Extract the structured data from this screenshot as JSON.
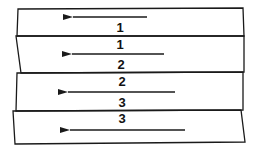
{
  "diagram": {
    "stroke_color": "#1a1a1a",
    "strips": [
      {
        "id": 1,
        "top_label": "",
        "bottom_label": "1",
        "points": "18,9 243,8 244,36 17,36",
        "arrow": {
          "x1": 147,
          "x2": 65,
          "y": 17
        }
      },
      {
        "id": 2,
        "top_label": "1",
        "bottom_label": "2",
        "points": "16,36 244,36 244,72 21,73",
        "arrow": {
          "x1": 164,
          "x2": 64,
          "y": 54
        }
      },
      {
        "id": 3,
        "top_label": "2",
        "bottom_label": "3",
        "points": "17,73 243,72 243,110 16,111",
        "arrow": {
          "x1": 175,
          "x2": 60,
          "y": 92
        }
      },
      {
        "id": 4,
        "top_label": "3",
        "bottom_label": "",
        "points": "13,111 241,110 245,142 15,144",
        "arrow": {
          "x1": 185,
          "x2": 62,
          "y": 130
        }
      }
    ],
    "labels": [
      {
        "text": "1",
        "x": 120,
        "y": 32
      },
      {
        "text": "1",
        "x": 120,
        "y": 49
      },
      {
        "text": "2",
        "x": 121,
        "y": 69
      },
      {
        "text": "2",
        "x": 122,
        "y": 86
      },
      {
        "text": "3",
        "x": 122,
        "y": 107
      },
      {
        "text": "3",
        "x": 122,
        "y": 123
      }
    ],
    "arrow_direction": "left"
  }
}
